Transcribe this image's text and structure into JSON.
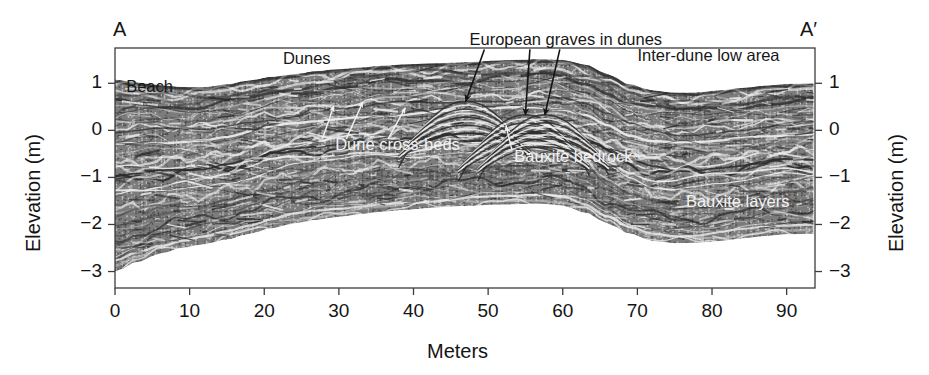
{
  "figure": {
    "type": "gpr-profile",
    "cross_section_start_label": "A",
    "cross_section_end_label": "A′",
    "xlabel": "Meters",
    "ylabel_left": "Elevation (m)",
    "ylabel_right": "Elevation (m)",
    "colors": {
      "axis": "#3c3c3c",
      "text_dark": "#141414",
      "text_light": "#f2f2f2",
      "radar_dark": "#2b2b2b",
      "radar_mid": "#7d7d7d",
      "radar_light": "#efefef",
      "background": "#ffffff"
    }
  },
  "chart_data": {
    "type": "area",
    "title": "",
    "xlabel": "Meters",
    "ylabel": "Elevation (m)",
    "xlim": [
      0,
      93.8
    ],
    "ylim": [
      -3.35,
      1.75
    ],
    "xticks": [
      0,
      10,
      20,
      30,
      40,
      50,
      60,
      70,
      80,
      90
    ],
    "xticklabels": [
      "0",
      "10",
      "20",
      "30",
      "40",
      "50",
      "60",
      "70",
      "80",
      "90"
    ],
    "yticks": [
      1,
      0,
      -1,
      -2,
      -3
    ],
    "yticklabels": [
      "1",
      "0",
      "−1",
      "−2",
      "−3"
    ],
    "grid": false,
    "legend": "none",
    "series": [
      {
        "name": "Ground surface (top of radar section)",
        "x": [
          0,
          3,
          6,
          9,
          12,
          15,
          18,
          21,
          24,
          27,
          30,
          33,
          36,
          39,
          42,
          45,
          48,
          51,
          54,
          57,
          60,
          63,
          66,
          69,
          72,
          75,
          78,
          81,
          84,
          87,
          90,
          93.8
        ],
        "y": [
          1.08,
          1.02,
          0.96,
          0.92,
          0.92,
          0.98,
          1.06,
          1.14,
          1.2,
          1.26,
          1.3,
          1.34,
          1.38,
          1.4,
          1.42,
          1.44,
          1.46,
          1.48,
          1.5,
          1.52,
          1.5,
          1.4,
          1.2,
          0.98,
          0.85,
          0.8,
          0.81,
          0.85,
          0.9,
          0.95,
          0.99,
          1.0
        ]
      },
      {
        "name": "Base of radar section",
        "x": [
          0,
          3,
          6,
          9,
          12,
          15,
          18,
          21,
          24,
          27,
          30,
          33,
          36,
          39,
          42,
          45,
          48,
          51,
          54,
          57,
          60,
          63,
          66,
          69,
          72,
          75,
          78,
          81,
          84,
          87,
          90,
          93.8
        ],
        "y": [
          -3.0,
          -2.8,
          -2.62,
          -2.5,
          -2.42,
          -2.32,
          -2.2,
          -2.08,
          -1.98,
          -1.9,
          -1.84,
          -1.78,
          -1.73,
          -1.69,
          -1.65,
          -1.62,
          -1.6,
          -1.58,
          -1.57,
          -1.56,
          -1.6,
          -1.75,
          -1.98,
          -2.2,
          -2.35,
          -2.4,
          -2.39,
          -2.35,
          -2.3,
          -2.25,
          -2.21,
          -2.2
        ]
      }
    ]
  },
  "annotations": {
    "dark_labels": [
      {
        "id": "beach",
        "text": "Beach",
        "x_m": 1.5,
        "elev_m": 0.92
      },
      {
        "id": "dunes",
        "text": "Dunes",
        "x_m": 22.5,
        "elev_m": 1.52
      },
      {
        "id": "european-graves",
        "text": "European graves in dunes",
        "x_m": 47.5,
        "elev_m": 1.93
      },
      {
        "id": "inter-dune-low-area",
        "text": "Inter-dune low area",
        "x_m": 70.0,
        "elev_m": 1.58
      }
    ],
    "light_labels": [
      {
        "id": "dune-cross-beds",
        "text": "Dune cross-beds",
        "x_m": 29.5,
        "elev_m": -0.32
      },
      {
        "id": "bauxite-bedrock",
        "text": "Bauxite bedrock",
        "x_m": 53.5,
        "elev_m": -0.56
      },
      {
        "id": "bauxite-layers",
        "text": "Bauxite layers",
        "x_m": 76.5,
        "elev_m": -1.52
      }
    ],
    "dark_arrows": [
      {
        "id": "grave-arrow-1",
        "x1_m": 49.5,
        "y1_m": 1.72,
        "x2_m": 47.0,
        "y2_m": 0.62
      },
      {
        "id": "grave-arrow-2",
        "x1_m": 55.6,
        "y1_m": 1.72,
        "x2_m": 55.0,
        "y2_m": 0.33
      },
      {
        "id": "grave-arrow-3",
        "x1_m": 59.6,
        "y1_m": 1.72,
        "x2_m": 57.6,
        "y2_m": 0.33
      }
    ],
    "light_arrows": [
      {
        "id": "cross-bed-arrow-1",
        "x1_m": 27.8,
        "y1_m": -0.18,
        "x2_m": 29.3,
        "y2_m": 0.52
      },
      {
        "id": "cross-bed-arrow-2",
        "x1_m": 31.0,
        "y1_m": -0.18,
        "x2_m": 33.2,
        "y2_m": 0.6
      },
      {
        "id": "cross-bed-arrow-3",
        "x1_m": 36.6,
        "y1_m": -0.18,
        "x2_m": 38.9,
        "y2_m": 0.48
      },
      {
        "id": "bedrock-arrow-1",
        "x1_m": 53.2,
        "y1_m": -0.42,
        "x2_m": 52.4,
        "y2_m": 0.1
      }
    ]
  }
}
